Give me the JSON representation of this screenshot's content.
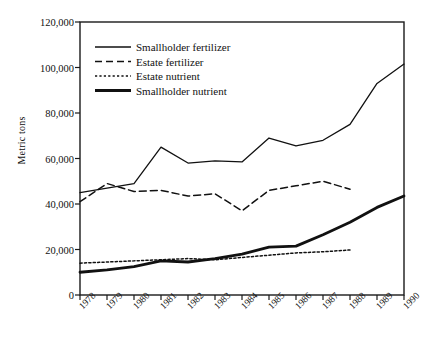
{
  "chart_data": {
    "type": "line",
    "title": "",
    "xlabel": "",
    "ylabel": "Metric tons",
    "grid": false,
    "legend_position": "top-left-inside",
    "x": [
      1978,
      1979,
      1980,
      1981,
      1982,
      1983,
      1984,
      1985,
      1986,
      1987,
      1988,
      1989,
      1990
    ],
    "categories": [
      "1978",
      "1979",
      "1980",
      "1981",
      "1982",
      "1983",
      "1984",
      "1985",
      "1986",
      "1987",
      "1988",
      "1989",
      "1990"
    ],
    "xlim": [
      1978,
      1990
    ],
    "ylim": [
      0,
      120000
    ],
    "yticks": [
      0,
      20000,
      40000,
      60000,
      80000,
      100000,
      120000
    ],
    "ytick_labels": [
      "0",
      "20,000",
      "40,000",
      "60,000",
      "80,000",
      "100,000",
      "120,000"
    ],
    "series": [
      {
        "name": "Smallholder fertilizer",
        "style": "solid-thin",
        "color": "#111111",
        "x": [
          1978,
          1979,
          1980,
          1981,
          1982,
          1983,
          1984,
          1985,
          1986,
          1987,
          1988,
          1989,
          1990
        ],
        "values": [
          45000,
          47000,
          49000,
          65000,
          58000,
          59000,
          58500,
          69000,
          65500,
          68000,
          75000,
          93000,
          101500
        ]
      },
      {
        "name": "Estate fertilizer",
        "style": "dashed",
        "color": "#111111",
        "x": [
          1978,
          1979,
          1980,
          1981,
          1982,
          1983,
          1984,
          1985,
          1986,
          1987,
          1988
        ],
        "values": [
          41000,
          49000,
          45500,
          46000,
          43500,
          44500,
          37000,
          46000,
          48000,
          50000,
          46500
        ]
      },
      {
        "name": "Estate nutrient",
        "style": "dotted",
        "color": "#111111",
        "x": [
          1978,
          1979,
          1980,
          1981,
          1982,
          1983,
          1984,
          1985,
          1986,
          1987,
          1988
        ],
        "values": [
          14000,
          14500,
          15000,
          15500,
          16000,
          15500,
          16500,
          17500,
          18500,
          19000,
          19800
        ]
      },
      {
        "name": "Smallholder nutrient",
        "style": "solid-thick",
        "color": "#111111",
        "x": [
          1978,
          1979,
          1980,
          1981,
          1982,
          1983,
          1984,
          1985,
          1986,
          1987,
          1988,
          1989,
          1990
        ],
        "values": [
          10000,
          11000,
          12500,
          15000,
          14500,
          16000,
          18000,
          21000,
          21500,
          26500,
          32000,
          38500,
          43500
        ]
      }
    ]
  },
  "legend": {
    "items": [
      {
        "label": "Smallholder fertilizer",
        "style": "solid-thin"
      },
      {
        "label": "Estate fertilizer",
        "style": "dashed"
      },
      {
        "label": "Estate nutrient",
        "style": "dotted"
      },
      {
        "label": "Smallholder nutrient",
        "style": "solid-thick"
      }
    ]
  }
}
